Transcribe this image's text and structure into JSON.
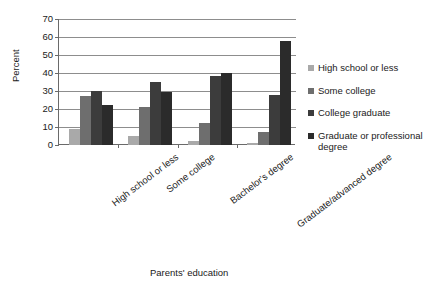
{
  "chart_data": {
    "type": "bar",
    "title": "",
    "xlabel": "Parents' education",
    "ylabel": "Percent",
    "ylim": [
      0,
      70
    ],
    "yticks": [
      0,
      10,
      20,
      30,
      40,
      50,
      60,
      70
    ],
    "grid": true,
    "legend_position": "right",
    "orientation": "vertical",
    "grouping": "clustered",
    "categories": [
      "High school or less",
      "Some college",
      "Bachelor's degree",
      "Graduate/advanced degree"
    ],
    "series": [
      {
        "name": "High school or less",
        "color": "#a9a9a9",
        "values": [
          9,
          5,
          2,
          1
        ]
      },
      {
        "name": "Some college",
        "color": "#6e6e6e",
        "values": [
          27,
          21,
          12.5,
          7
        ]
      },
      {
        "name": "College graduate",
        "color": "#3c3c3c",
        "values": [
          30,
          35,
          38.5,
          28
        ]
      },
      {
        "name": "Graduate or professional degree",
        "color": "#2b2b2b",
        "values": [
          22,
          29.5,
          40,
          58
        ]
      }
    ]
  },
  "axes": {
    "y_title": "Percent",
    "x_title": "Parents' education",
    "y_tick_labels": [
      "0",
      "10",
      "20",
      "30",
      "40",
      "50",
      "60",
      "70"
    ],
    "x_tick_labels": [
      "High school or less",
      "Some college",
      "Bachelor's degree",
      "Graduate/advanced degree"
    ]
  },
  "legend": {
    "entries": [
      {
        "label": "High school or less",
        "color": "#a9a9a9"
      },
      {
        "label": "Some college",
        "color": "#6e6e6e"
      },
      {
        "label": "College graduate",
        "color": "#3c3c3c"
      },
      {
        "label": "Graduate or professional degree",
        "color": "#2b2b2b"
      }
    ]
  }
}
